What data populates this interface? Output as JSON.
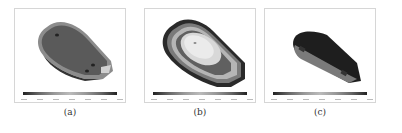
{
  "figure": {
    "panels": [
      {
        "id": "a",
        "caption": "(a)",
        "description": "dark gray teardrop-shaped contour plot with lighter rim"
      },
      {
        "id": "b",
        "caption": "(b)",
        "description": "teardrop-shaped contour plot with concentric bands, light center"
      },
      {
        "id": "c",
        "caption": "(c)",
        "description": "elongated dark contour plot viewed at an angle"
      }
    ],
    "colorbar_gradient": [
      "#222222",
      "#666666",
      "#999999",
      "#bbbbbb",
      "#999999",
      "#666666",
      "#222222"
    ]
  }
}
